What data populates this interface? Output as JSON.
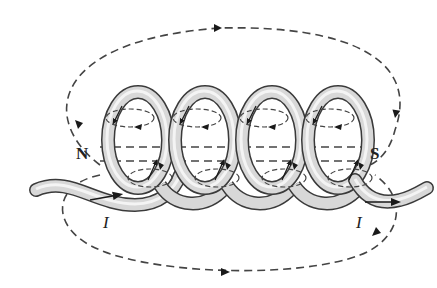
{
  "figure": {
    "labels": {
      "north": "N",
      "south": "S",
      "current_left": "I",
      "current_right": "I"
    },
    "colors": {
      "wire_outline": "#3a3a3a",
      "wire_fill": "#d8d8d8",
      "wire_highlight": "#f4f4f4",
      "field_line": "#444444",
      "arrow": "#1a1a1a",
      "background": "#ffffff"
    },
    "coil": {
      "turns": 4
    },
    "field_lines": [
      {
        "name": "outer-top-loop",
        "direction": "left-to-right over top"
      },
      {
        "name": "outer-bottom-loop",
        "direction": "left-to-right under bottom"
      },
      {
        "name": "axial-upper",
        "direction": "through core"
      },
      {
        "name": "axial-lower",
        "direction": "through core"
      }
    ]
  }
}
